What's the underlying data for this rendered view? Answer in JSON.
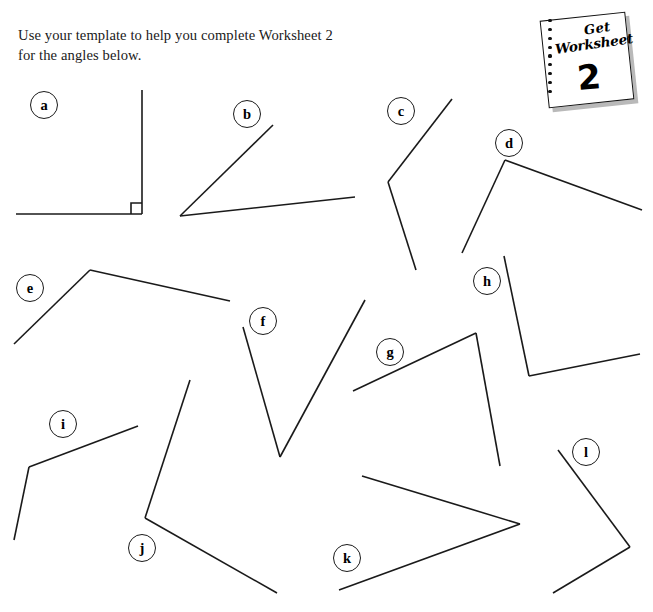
{
  "instruction": {
    "line1": "Use your template to help you complete Worksheet 2",
    "line2": "for the angles below."
  },
  "worksheet_badge": {
    "script_line1": "Get",
    "script_line2": "Worksheet",
    "number": "2",
    "hole_count": 9
  },
  "style": {
    "stroke_color": "#1a1a1a",
    "stroke_width": 1.6,
    "background": "#ffffff",
    "label_text_color": "#000000"
  },
  "angles": [
    {
      "label": "a",
      "label_pos": {
        "x": 30,
        "y": 91
      },
      "vertex": {
        "x": 142,
        "y": 214
      },
      "ray1_end": {
        "x": 142,
        "y": 90
      },
      "ray2_end": {
        "x": 16,
        "y": 214
      },
      "right_angle_marker": true,
      "marker_size": 11
    },
    {
      "label": "b",
      "label_pos": {
        "x": 233,
        "y": 100
      },
      "vertex": {
        "x": 180,
        "y": 216
      },
      "ray1_end": {
        "x": 273,
        "y": 125
      },
      "ray2_end": {
        "x": 355,
        "y": 197
      },
      "right_angle_marker": false
    },
    {
      "label": "c",
      "label_pos": {
        "x": 387,
        "y": 97
      },
      "vertex": {
        "x": 388,
        "y": 182
      },
      "ray1_end": {
        "x": 452,
        "y": 99
      },
      "ray2_end": {
        "x": 416,
        "y": 270
      },
      "right_angle_marker": false
    },
    {
      "label": "d",
      "label_pos": {
        "x": 495,
        "y": 129
      },
      "vertex": {
        "x": 505,
        "y": 160
      },
      "ray1_end": {
        "x": 462,
        "y": 253
      },
      "ray2_end": {
        "x": 642,
        "y": 210
      },
      "right_angle_marker": false
    },
    {
      "label": "e",
      "label_pos": {
        "x": 16,
        "y": 274
      },
      "vertex": {
        "x": 90,
        "y": 270
      },
      "ray1_end": {
        "x": 14,
        "y": 344
      },
      "ray2_end": {
        "x": 230,
        "y": 301
      },
      "right_angle_marker": false
    },
    {
      "label": "f",
      "label_pos": {
        "x": 249,
        "y": 307
      },
      "vertex": {
        "x": 280,
        "y": 457
      },
      "ray1_end": {
        "x": 243,
        "y": 327
      },
      "ray2_end": {
        "x": 365,
        "y": 300
      },
      "right_angle_marker": false
    },
    {
      "label": "g",
      "label_pos": {
        "x": 376,
        "y": 338
      },
      "vertex": {
        "x": 476,
        "y": 333
      },
      "ray1_end": {
        "x": 353,
        "y": 391
      },
      "ray2_end": {
        "x": 500,
        "y": 466
      },
      "right_angle_marker": false
    },
    {
      "label": "h",
      "label_pos": {
        "x": 473,
        "y": 267
      },
      "vertex": {
        "x": 529,
        "y": 376
      },
      "ray1_end": {
        "x": 504,
        "y": 256
      },
      "ray2_end": {
        "x": 640,
        "y": 354
      },
      "right_angle_marker": false
    },
    {
      "label": "i",
      "label_pos": {
        "x": 49,
        "y": 410
      },
      "vertex": {
        "x": 29,
        "y": 467
      },
      "ray1_end": {
        "x": 138,
        "y": 426
      },
      "ray2_end": {
        "x": 14,
        "y": 540
      },
      "right_angle_marker": false
    },
    {
      "label": "j",
      "label_pos": {
        "x": 128,
        "y": 534
      },
      "vertex": {
        "x": 145,
        "y": 518
      },
      "ray1_end": {
        "x": 190,
        "y": 380
      },
      "ray2_end": {
        "x": 277,
        "y": 593
      },
      "right_angle_marker": false
    },
    {
      "label": "k",
      "label_pos": {
        "x": 333,
        "y": 544
      },
      "vertex": {
        "x": 520,
        "y": 524
      },
      "ray1_end": {
        "x": 362,
        "y": 476
      },
      "ray2_end": {
        "x": 339,
        "y": 590
      },
      "right_angle_marker": false
    },
    {
      "label": "l",
      "label_pos": {
        "x": 572,
        "y": 438
      },
      "vertex": {
        "x": 630,
        "y": 547
      },
      "ray1_end": {
        "x": 558,
        "y": 450
      },
      "ray2_end": {
        "x": 553,
        "y": 593
      },
      "right_angle_marker": false
    }
  ]
}
